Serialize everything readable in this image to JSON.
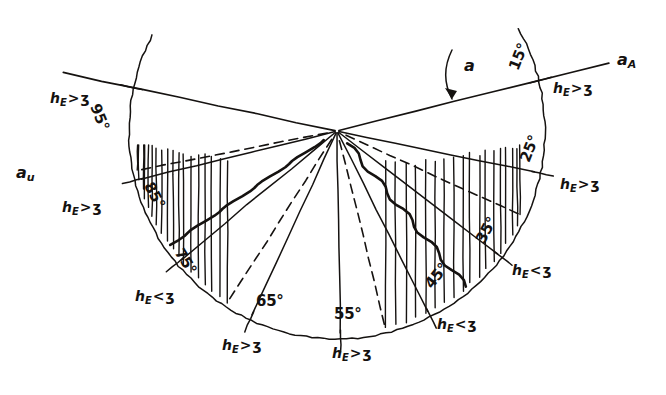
{
  "diagram": {
    "vertex": {
      "x": 337,
      "y": 131
    },
    "radius": 208,
    "ink_color": "#151210",
    "background_color": "#ffffff",
    "relation_symbol": "ʒ",
    "height_symbol": "h",
    "height_subscript": "E",
    "rotation_arrow_label": "a",
    "axis_labels": [
      {
        "name": "axis-right",
        "base": "a",
        "sub": "A",
        "x": 617,
        "y": 50
      },
      {
        "name": "axis-left",
        "base": "a",
        "sub": "u",
        "x": 16,
        "y": 163
      }
    ],
    "angles": [
      {
        "deg": "15°",
        "condition": "gt",
        "value": 15,
        "ang_x": 505,
        "ang_y": 66,
        "ang_rot": -68,
        "cond_x": 553,
        "cond_y": 80,
        "cond_rot": 0
      },
      {
        "deg": "25°",
        "condition": "gt",
        "value": 25,
        "ang_x": 516,
        "ang_y": 158,
        "ang_rot": -68,
        "cond_x": 560,
        "cond_y": 176,
        "cond_rot": 0
      },
      {
        "deg": "35°",
        "condition": "lt",
        "value": 35,
        "ang_x": 472,
        "ang_y": 238,
        "ang_rot": -62,
        "cond_x": 512,
        "cond_y": 262,
        "cond_rot": 0
      },
      {
        "deg": "45°",
        "condition": "lt",
        "value": 45,
        "ang_x": 421,
        "ang_y": 281,
        "ang_rot": -52,
        "cond_x": 437,
        "cond_y": 316,
        "cond_rot": 0
      },
      {
        "deg": "55°",
        "condition": "gt",
        "value": 55,
        "ang_x": 334,
        "ang_y": 305,
        "ang_rot": 0,
        "cond_x": 332,
        "cond_y": 345,
        "cond_rot": 0
      },
      {
        "deg": "65°",
        "condition": "gt",
        "value": 65,
        "ang_x": 256,
        "ang_y": 292,
        "ang_rot": 0,
        "cond_x": 222,
        "cond_y": 337,
        "cond_rot": 0
      },
      {
        "deg": "75°",
        "condition": "lt",
        "value": 75,
        "ang_x": 186,
        "ang_y": 245,
        "ang_rot": 58,
        "cond_x": 135,
        "cond_y": 288,
        "cond_rot": 0
      },
      {
        "deg": "85°",
        "condition": "gt",
        "value": 85,
        "ang_x": 156,
        "ang_y": 179,
        "ang_rot": 62,
        "cond_x": 62,
        "cond_y": 199,
        "cond_rot": 0
      },
      {
        "deg": "95°",
        "condition": "gt",
        "value": 95,
        "ang_x": 103,
        "ang_y": 101,
        "ang_rot": 68,
        "cond_x": 50,
        "cond_y": 90,
        "cond_rot": 0
      }
    ],
    "hatched_bands": [
      {
        "name": "left-band",
        "from_deg": 68,
        "to_deg": 86
      },
      {
        "name": "right-band",
        "from_deg": 30,
        "to_deg": 50
      }
    ]
  }
}
